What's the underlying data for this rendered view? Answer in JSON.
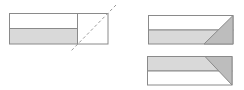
{
  "diagram": {
    "colors": {
      "stroke": "#8a8a8a",
      "light_fill": "#ffffff",
      "shade_fill": "#d9d9d9",
      "dark_shade_fill": "#bdbdbd",
      "dashed_line": "#9a9a9a"
    },
    "left_figure": {
      "label": "original-strip-with-fold-line",
      "rect": {
        "x": 9,
        "y": 13,
        "w": 99,
        "h": 31
      },
      "divider_y": 28,
      "square_divider_x": 77,
      "fold_line": {
        "x1": 116,
        "y1": 5,
        "x2": 70,
        "y2": 52
      }
    },
    "top_right_figure": {
      "label": "folded-result-a",
      "rect": {
        "x": 148,
        "y": 15,
        "w": 85,
        "h": 29
      },
      "divider_y": 30,
      "fold_triangle": [
        [
          233,
          15
        ],
        [
          233,
          44
        ],
        [
          204,
          44
        ]
      ]
    },
    "bottom_right_figure": {
      "label": "folded-result-b",
      "rect": {
        "x": 147,
        "y": 56,
        "w": 85,
        "h": 29
      },
      "divider_y": 71,
      "fold_triangle": [
        [
          205,
          56
        ],
        [
          232,
          56
        ],
        [
          232,
          85
        ]
      ]
    }
  }
}
